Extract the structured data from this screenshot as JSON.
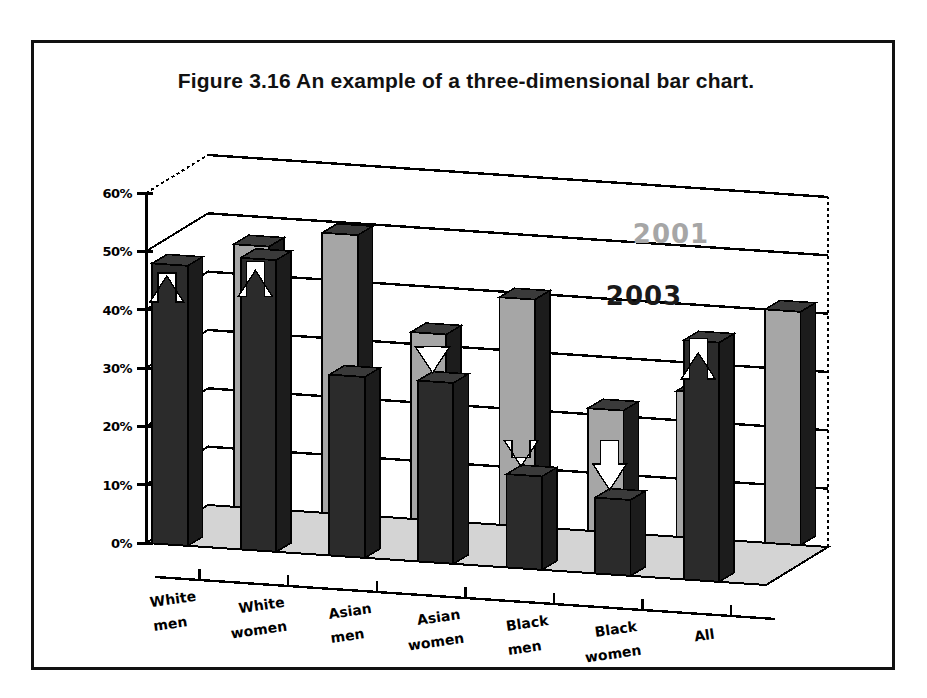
{
  "figure": {
    "caption": "Figure 3.16    An example of a three-dimensional bar chart."
  },
  "colors": {
    "frame": "#111111",
    "series_2003": "#2b2b2b",
    "series_2001": "#a6a6a6",
    "floor": "#d4d4d4",
    "axis": "#000000",
    "arrow": "#ffffff",
    "legend_2001_text": "#a6a6a6",
    "legend_2003_text": "#1a1a1a"
  },
  "chart_data": {
    "type": "bar",
    "title": "An example of a three-dimensional bar chart.",
    "xlabel": "",
    "ylabel": "",
    "ylim": [
      0,
      60
    ],
    "yticks": [
      0,
      10,
      20,
      30,
      40,
      50,
      60
    ],
    "ytick_labels": [
      "0%",
      "10%",
      "20%",
      "30%",
      "40%",
      "50%",
      "60%"
    ],
    "grid": true,
    "three_dimensional": true,
    "legend_position": "upper-right-inside",
    "categories": [
      "White men",
      "White women",
      "Asian men",
      "Asian women",
      "Black men",
      "Black women",
      "All"
    ],
    "category_lines": [
      [
        "White",
        "men"
      ],
      [
        "White",
        "women"
      ],
      [
        "Asian",
        "men"
      ],
      [
        "Asian",
        "women"
      ],
      [
        "Black",
        "men"
      ],
      [
        "Black",
        "women"
      ],
      [
        "All",
        ""
      ]
    ],
    "series": [
      {
        "name": "2003",
        "values": [
          48,
          50,
          31,
          31,
          16,
          13,
          41
        ]
      },
      {
        "name": "2001",
        "values": [
          45,
          48,
          32,
          39,
          21,
          25,
          40
        ]
      }
    ],
    "annotations": [
      {
        "category": "White men",
        "arrow": "up"
      },
      {
        "category": "White women",
        "arrow": "up"
      },
      {
        "category": "Asian men",
        "arrow": "none"
      },
      {
        "category": "Asian women",
        "arrow": "down"
      },
      {
        "category": "Black men",
        "arrow": "down"
      },
      {
        "category": "Black women",
        "arrow": "down"
      },
      {
        "category": "All",
        "arrow": "up"
      }
    ]
  },
  "legend": {
    "entries": [
      {
        "label": "2001",
        "color": "#a6a6a6"
      },
      {
        "label": "2003",
        "color": "#1a1a1a"
      }
    ]
  }
}
